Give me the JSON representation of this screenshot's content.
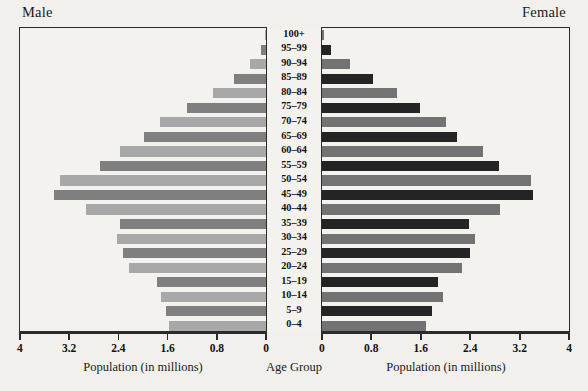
{
  "titles": {
    "male": "Male",
    "female": "Female",
    "center_axis": "Age Group",
    "male_axis": "Population (in millions)",
    "female_axis": "Population (in millions)"
  },
  "axis": {
    "male_ticks": [
      "4",
      "3.2",
      "2.4",
      "1.6",
      "0.8",
      "0"
    ],
    "female_ticks": [
      "0",
      "0.8",
      "1.6",
      "2.4",
      "3.2",
      "4"
    ],
    "max": 4,
    "tick_step": 0.8,
    "unit": "millions"
  },
  "colors": {
    "male_dark": "#7f7f7f",
    "male_light": "#a8a8a8",
    "female_dark": "#242424",
    "female_light": "#737373",
    "frame": "#2b2b2b",
    "background": "#f2f0ec",
    "plot_background": "#f4f2ee",
    "text": "#121212"
  },
  "chart_data": {
    "type": "bar",
    "xlabel": "Population (in millions)",
    "ylabel": "Age Group",
    "xlim": [
      0,
      4
    ],
    "grid": false,
    "legend": [
      "Male",
      "Female"
    ],
    "legend_position": "top-outside",
    "categories": [
      "100+",
      "95–99",
      "90–94",
      "85–89",
      "80–84",
      "75–79",
      "70–74",
      "65–69",
      "60–64",
      "55–59",
      "50–54",
      "45–49",
      "40–44",
      "35–39",
      "30–34",
      "25–29",
      "20–24",
      "15–19",
      "10–14",
      "5–9",
      "0–4"
    ],
    "series": [
      {
        "name": "Male",
        "values": [
          0.02,
          0.08,
          0.26,
          0.52,
          0.86,
          1.28,
          1.72,
          1.98,
          2.38,
          2.7,
          3.35,
          3.45,
          2.92,
          2.38,
          2.42,
          2.32,
          2.22,
          1.78,
          1.7,
          1.62,
          1.58
        ]
      },
      {
        "name": "Female",
        "values": [
          0.03,
          0.14,
          0.45,
          0.82,
          1.22,
          1.58,
          2.0,
          2.18,
          2.6,
          2.86,
          3.38,
          3.42,
          2.88,
          2.38,
          2.48,
          2.4,
          2.26,
          1.88,
          1.96,
          1.78,
          1.68
        ]
      }
    ]
  }
}
